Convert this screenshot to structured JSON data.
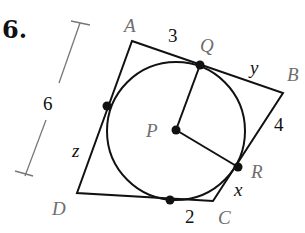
{
  "problem": {
    "number": "6."
  },
  "figure": {
    "quadrilateral": {
      "vertices": [
        {
          "name": "A",
          "x": 132,
          "y": 41
        },
        {
          "name": "B",
          "x": 283,
          "y": 93
        },
        {
          "name": "C",
          "x": 213,
          "y": 201
        },
        {
          "name": "D",
          "x": 77,
          "y": 193
        }
      ]
    },
    "circle": {
      "center": "P",
      "cx": 176,
      "cy": 131,
      "r": 69
    },
    "tangent_points": [
      {
        "name": "Q",
        "x": 200,
        "y": 65
      },
      {
        "name": "R",
        "x": 238,
        "y": 167
      },
      {
        "name": "left",
        "x": 107,
        "y": 106
      },
      {
        "name": "bottom",
        "x": 170,
        "y": 200
      }
    ],
    "radii": [
      "PQ",
      "PR"
    ],
    "labels": {
      "A": "A",
      "B": "B",
      "C": "C",
      "D": "D",
      "P": "P",
      "Q": "Q",
      "R": "R"
    },
    "measures": {
      "AQ": "3",
      "QB": "y",
      "BR": "4",
      "RC": "x",
      "C_bottom": "2",
      "DA_side": "z",
      "dimension_AD": "6"
    }
  }
}
